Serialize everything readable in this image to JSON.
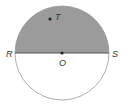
{
  "diagram": {
    "type": "circle-with-diameter",
    "circle": {
      "cx": 62,
      "cy": 53,
      "r": 47,
      "stroke": "#9a9a9a",
      "fill": "#ffffff"
    },
    "shaded_region": {
      "description": "upper semicircle",
      "fill": "#9b9b9b"
    },
    "diameter": {
      "from": "R",
      "to": "S",
      "stroke": "#555555"
    },
    "points": [
      {
        "label": "T",
        "x": 50,
        "y": 19,
        "label_x": 55,
        "label_y": 20
      },
      {
        "label": "O",
        "x": 62,
        "y": 53,
        "label_x": 59,
        "label_y": 66
      }
    ],
    "endpoint_labels": [
      {
        "label": "R",
        "x": 6,
        "y": 57
      },
      {
        "label": "S",
        "x": 112,
        "y": 57
      }
    ]
  }
}
